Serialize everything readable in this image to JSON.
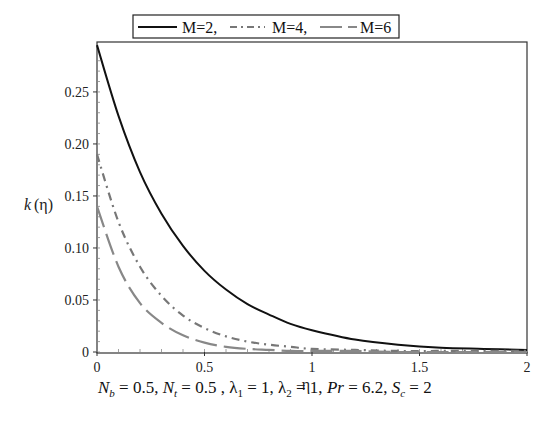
{
  "chart_data": {
    "type": "line",
    "title": "",
    "xlabel": "η",
    "ylabel": "k(η)",
    "xlim": [
      0,
      2
    ],
    "ylim": [
      0,
      0.298
    ],
    "x_ticks": [
      "0",
      "0.5",
      "1",
      "1.5",
      "2"
    ],
    "y_ticks": [
      "0",
      "0.05",
      "0.10",
      "0.15",
      "0.20",
      "0.25"
    ],
    "grid": false,
    "legend_position": "top (above plot, boxed)",
    "legend": [
      "M=2,",
      "M=4,",
      "M=6"
    ],
    "x": [
      0,
      0.1,
      0.2,
      0.3,
      0.4,
      0.5,
      0.6,
      0.7,
      0.8,
      0.9,
      1.0,
      1.2,
      1.4,
      1.6,
      1.8,
      2.0
    ],
    "series": [
      {
        "name": "M=2",
        "style": "solid",
        "color": "#111111",
        "values": [
          0.295,
          0.227,
          0.173,
          0.133,
          0.102,
          0.078,
          0.06,
          0.046,
          0.036,
          0.027,
          0.021,
          0.012,
          0.007,
          0.004,
          0.003,
          0.002
        ]
      },
      {
        "name": "M=4",
        "style": "dash-dot",
        "color": "#777777",
        "values": [
          0.19,
          0.125,
          0.082,
          0.054,
          0.035,
          0.023,
          0.015,
          0.01,
          0.007,
          0.005,
          0.003,
          0.002,
          0.001,
          0.001,
          0.001,
          0.001
        ]
      },
      {
        "name": "M=6",
        "style": "long-dash",
        "color": "#888888",
        "values": [
          0.14,
          0.082,
          0.047,
          0.028,
          0.016,
          0.009,
          0.005,
          0.003,
          0.002,
          0.001,
          0.001,
          0.001,
          0.0,
          0.0,
          0.0,
          0.0
        ]
      }
    ],
    "annotation": "N_b = 0.5, N_t = 0.5 , λ_1 = 1, λ_2 = 1, Pr = 6.2, S_c = 2"
  },
  "legend": {
    "items": [
      "M=2,",
      "M=4,",
      "M=6"
    ]
  },
  "axes": {
    "xlabel": "η",
    "ylabel_k": "k",
    "ylabel_paren": "(η)"
  },
  "caption": {
    "nb_sym": "N",
    "nb_sub": "b",
    "nb_val": " = 0.5, ",
    "nt_sym": "N",
    "nt_sub": "t",
    "nt_val": " = 0.5 , ",
    "l1_sym": "λ",
    "l1_sub": "1",
    "l1_val": " = 1, ",
    "l2_sym": "λ",
    "l2_sub": "2",
    "l2_val": " = 1, ",
    "pr_sym": "Pr",
    "pr_val": " = 6.2, ",
    "sc_sym": "S",
    "sc_sub": "c",
    "sc_val": " = 2"
  }
}
